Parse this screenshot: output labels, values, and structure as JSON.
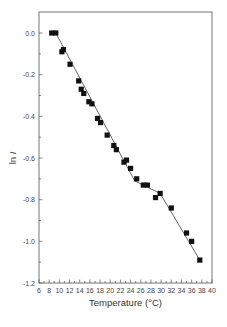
{
  "chart_data": {
    "type": "scatter",
    "title": "",
    "xlabel": "Temperature (°C)",
    "ylabel": "ln I",
    "xlim": [
      6,
      40
    ],
    "ylim": [
      -1.2,
      0.1
    ],
    "xticks": [
      6,
      8,
      10,
      12,
      14,
      16,
      18,
      20,
      22,
      24,
      26,
      28,
      30,
      32,
      34,
      36,
      38,
      40
    ],
    "yticks": [
      0.0,
      -0.2,
      -0.4,
      -0.6,
      -0.8,
      -1.0,
      -1.2
    ],
    "ytick_labels": [
      "0.0",
      "-0.2",
      "-0.4",
      "-0.6",
      "-0.8",
      "-1.0",
      "-1.2"
    ],
    "grid": false,
    "legend": null,
    "series": [
      {
        "name": "data",
        "marker": "square",
        "color": "#111111",
        "x": [
          8.5,
          9.3,
          10.5,
          10.8,
          12.1,
          13.8,
          14.3,
          14.8,
          15.8,
          16.4,
          17.5,
          18.1,
          19.4,
          20.7,
          21.2,
          22.7,
          23.2,
          24.0,
          25.2,
          26.5,
          27.3,
          28.9,
          29.8,
          32.0,
          35.0,
          36.0,
          37.6
        ],
        "y": [
          0.0,
          0.0,
          -0.09,
          -0.08,
          -0.15,
          -0.23,
          -0.27,
          -0.29,
          -0.33,
          -0.34,
          -0.41,
          -0.43,
          -0.49,
          -0.54,
          -0.56,
          -0.62,
          -0.61,
          -0.65,
          -0.7,
          -0.73,
          -0.73,
          -0.79,
          -0.77,
          -0.84,
          -0.96,
          -1.0,
          -1.09
        ]
      },
      {
        "name": "piecewise linear fit",
        "type": "line",
        "color": "#555555",
        "x": [
          9.3,
          24.8,
          29.8,
          37.6
        ],
        "y": [
          0.0,
          -0.71,
          -0.77,
          -1.09
        ]
      }
    ]
  }
}
